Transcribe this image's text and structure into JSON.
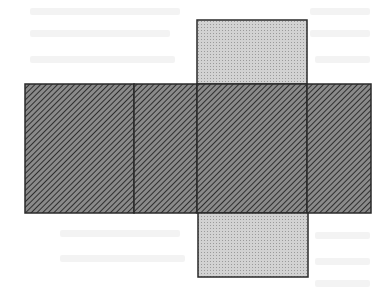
{
  "figure": {
    "type": "cube-net",
    "colors": {
      "background": "#ffffff",
      "outline": "#2a2a2a",
      "hatch_fill": "#8a8a8a",
      "hatch_line": "#2e2e2e",
      "dot_fill": "#d2d2d2",
      "dot_mark": "#9a9a9a"
    },
    "faces": [
      {
        "id": "top",
        "pattern": "dotted",
        "x": 197,
        "y": 20,
        "w": 110,
        "h": 64
      },
      {
        "id": "left",
        "pattern": "hatched",
        "x": 25,
        "y": 84,
        "w": 109,
        "h": 129
      },
      {
        "id": "left-center",
        "pattern": "hatched",
        "x": 134,
        "y": 84,
        "w": 63,
        "h": 129
      },
      {
        "id": "center",
        "pattern": "hatched",
        "x": 197,
        "y": 84,
        "w": 110,
        "h": 129
      },
      {
        "id": "right",
        "pattern": "hatched",
        "x": 307,
        "y": 84,
        "w": 64,
        "h": 129
      },
      {
        "id": "bottom",
        "pattern": "dotted",
        "x": 198,
        "y": 213,
        "w": 110,
        "h": 64
      }
    ]
  }
}
